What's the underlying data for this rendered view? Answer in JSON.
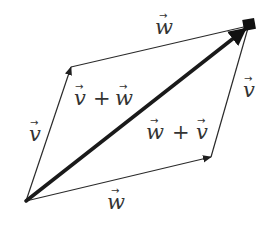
{
  "diagram": {
    "title": "",
    "colors": {
      "background": "#ffffff",
      "edge": "#2a2a2a",
      "diagonal": "#1a1a1a",
      "text": "#333333"
    },
    "vertices": {
      "origin": {
        "x": 26,
        "y": 201
      },
      "v_tip": {
        "x": 71,
        "y": 67
      },
      "w_tip": {
        "x": 211,
        "y": 157
      },
      "sum_tip": {
        "x": 250,
        "y": 25
      }
    },
    "edges": [
      {
        "id": "v-left",
        "from": "origin",
        "to": "v_tip",
        "label": "v",
        "style": "thin"
      },
      {
        "id": "w-top",
        "from": "v_tip",
        "to": "sum_tip",
        "label": "w",
        "style": "thin"
      },
      {
        "id": "w-bottom",
        "from": "origin",
        "to": "w_tip",
        "label": "w",
        "style": "thin"
      },
      {
        "id": "v-right",
        "from": "w_tip",
        "to": "sum_tip",
        "label": "v",
        "style": "thin"
      },
      {
        "id": "diagonal",
        "from": "origin",
        "to": "sum_tip",
        "label": "sum",
        "style": "thick"
      }
    ],
    "labels": {
      "v_left": {
        "var": "v",
        "x": 29,
        "y": 141
      },
      "w_top": {
        "var": "w",
        "x": 155,
        "y": 34
      },
      "w_bottom": {
        "var": "w",
        "x": 107,
        "y": 209
      },
      "v_right": {
        "var": "v",
        "x": 243,
        "y": 97
      },
      "v_plus_w": {
        "first": "v",
        "plus": "+",
        "second": "w",
        "x": 74,
        "y": 105
      },
      "w_plus_v": {
        "first": "w",
        "plus": "+",
        "second": "v",
        "x": 146,
        "y": 139
      }
    }
  }
}
